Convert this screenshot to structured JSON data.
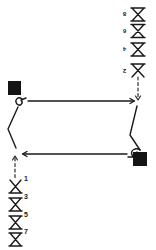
{
  "diagram": {
    "type": "formation-play-diagram",
    "colors": {
      "ink": "#1a1a1a",
      "box": "#141414",
      "background": "#ffffff"
    },
    "right_column": {
      "symbol": "hourglass",
      "labels": [
        "8",
        "6",
        "4",
        "2"
      ]
    },
    "left_column": {
      "symbol": "hourglass",
      "labels": [
        "1",
        "3",
        "5",
        "7"
      ]
    },
    "markers": [
      {
        "name": "left-marker",
        "shape": "filled-square"
      },
      {
        "name": "right-marker",
        "shape": "filled-square"
      }
    ],
    "arrows": [
      {
        "name": "top-arrow",
        "direction": "right"
      },
      {
        "name": "bottom-arrow",
        "direction": "left"
      }
    ]
  }
}
